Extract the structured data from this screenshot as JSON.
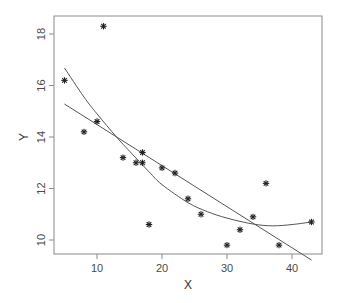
{
  "chart_data": {
    "type": "scatter",
    "title": "",
    "xlabel": "X",
    "ylabel": "Y",
    "xlim": [
      4,
      45
    ],
    "ylim": [
      9.45,
      18.75
    ],
    "grid": false,
    "legend": null,
    "x_ticks": [
      10,
      20,
      30,
      40
    ],
    "y_ticks": [
      10,
      12,
      14,
      16,
      18
    ],
    "marker": "*",
    "points": [
      {
        "x": 5,
        "y": 16.2
      },
      {
        "x": 8,
        "y": 14.2
      },
      {
        "x": 10,
        "y": 14.6
      },
      {
        "x": 11,
        "y": 18.3
      },
      {
        "x": 14,
        "y": 13.2
      },
      {
        "x": 16,
        "y": 13.0
      },
      {
        "x": 17,
        "y": 13.0
      },
      {
        "x": 17,
        "y": 13.4
      },
      {
        "x": 18,
        "y": 10.6
      },
      {
        "x": 20,
        "y": 12.8
      },
      {
        "x": 22,
        "y": 12.6
      },
      {
        "x": 24,
        "y": 11.6
      },
      {
        "x": 26,
        "y": 11.0
      },
      {
        "x": 30,
        "y": 9.8
      },
      {
        "x": 32,
        "y": 10.4
      },
      {
        "x": 34,
        "y": 10.9
      },
      {
        "x": 36,
        "y": 12.2
      },
      {
        "x": 38,
        "y": 9.8
      },
      {
        "x": 43,
        "y": 10.7
      }
    ],
    "series": [
      {
        "name": "linear fit",
        "type": "line",
        "x": [
          5,
          43
        ],
        "y": [
          15.28,
          9.22
        ]
      },
      {
        "name": "smooth fit",
        "type": "line",
        "x": [
          5,
          8,
          10,
          13,
          15,
          18,
          20,
          24,
          27,
          30,
          34,
          37,
          40,
          43
        ],
        "y": [
          16.68,
          15.55,
          14.9,
          14.0,
          13.45,
          12.65,
          12.15,
          11.45,
          11.1,
          10.85,
          10.62,
          10.55,
          10.6,
          10.7
        ]
      }
    ]
  }
}
